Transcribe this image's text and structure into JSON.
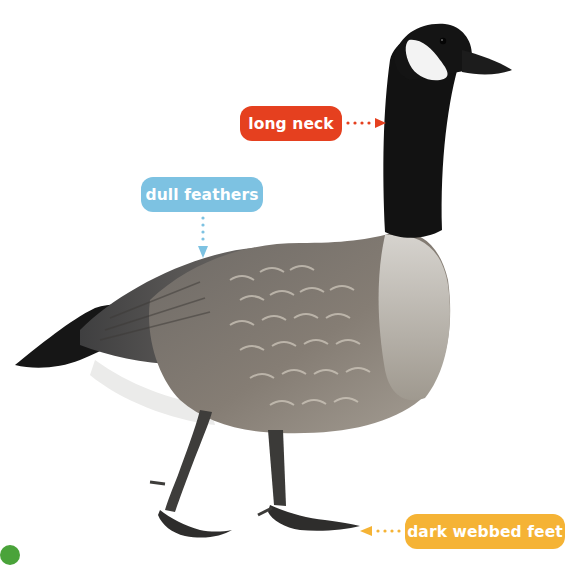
{
  "diagram": {
    "labels": [
      {
        "id": "neck",
        "text": "long neck",
        "color": "#e5401f",
        "points_to": "neck",
        "arrow_direction": "right"
      },
      {
        "id": "feathers",
        "text": "dull feathers",
        "color": "#7dc2e2",
        "points_to": "back feathers",
        "arrow_direction": "down"
      },
      {
        "id": "feet",
        "text": "dark webbed feet",
        "color": "#f5b335",
        "points_to": "feet",
        "arrow_direction": "left"
      }
    ]
  },
  "colors": {
    "background": "#ffffff",
    "neck_black": "#111111",
    "cheek_white": "#f4f4f4",
    "body_gray": "#7d7770",
    "body_light": "#b9b4ac",
    "wing_dark": "#4b4a4a",
    "tail_black": "#151515",
    "legs": "#3e3d3b",
    "leaf_green": "#4aa33a"
  }
}
